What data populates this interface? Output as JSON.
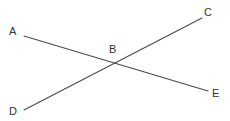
{
  "diagram": {
    "type": "intersecting-lines",
    "stroke_color": "#4a4a4a",
    "label_color": "#333333",
    "points": [
      {
        "id": "A",
        "label": "A",
        "x": 24,
        "y": 36,
        "label_x": 9,
        "label_y": 26
      },
      {
        "id": "B",
        "label": "B",
        "x": 118,
        "y": 64,
        "label_x": 109,
        "label_y": 44
      },
      {
        "id": "C",
        "label": "C",
        "x": 202,
        "y": 18,
        "label_x": 204,
        "label_y": 7
      },
      {
        "id": "D",
        "label": "D",
        "x": 24,
        "y": 110,
        "label_x": 9,
        "label_y": 106
      },
      {
        "id": "E",
        "label": "E",
        "x": 208,
        "y": 91,
        "label_x": 212,
        "label_y": 88
      }
    ],
    "segments": [
      {
        "id": "AE",
        "from": "A",
        "to": "E",
        "x1": 24,
        "y1": 36,
        "x2": 208,
        "y2": 91
      },
      {
        "id": "DC",
        "from": "D",
        "to": "C",
        "x1": 24,
        "y1": 110,
        "x2": 202,
        "y2": 18
      }
    ]
  }
}
